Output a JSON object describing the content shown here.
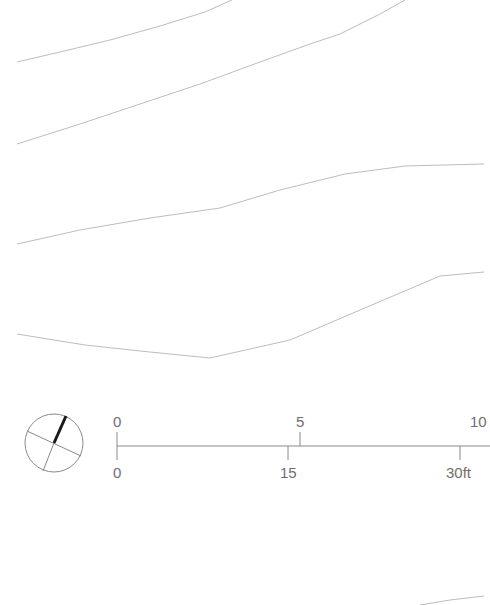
{
  "drawing": {
    "type": "site plan contour lines",
    "contour_color": "#bdbdbd",
    "contours": [
      {
        "id": "c1",
        "points": [
          [
            17,
            62
          ],
          [
            60,
            52
          ],
          [
            110,
            40
          ],
          [
            160,
            26
          ],
          [
            205,
            12
          ],
          [
            232,
            0
          ]
        ]
      },
      {
        "id": "c2",
        "points": [
          [
            17,
            144
          ],
          [
            80,
            124
          ],
          [
            140,
            104
          ],
          [
            200,
            84
          ],
          [
            260,
            62
          ],
          [
            310,
            44
          ],
          [
            340,
            34
          ],
          [
            380,
            14
          ],
          [
            405,
            0
          ]
        ]
      },
      {
        "id": "c3",
        "points": [
          [
            17,
            244
          ],
          [
            80,
            230
          ],
          [
            150,
            218
          ],
          [
            220,
            208
          ],
          [
            280,
            190
          ],
          [
            345,
            174
          ],
          [
            405,
            166
          ],
          [
            484,
            164
          ]
        ]
      },
      {
        "id": "c4",
        "points": [
          [
            17,
            334
          ],
          [
            85,
            345
          ],
          [
            150,
            352
          ],
          [
            210,
            358
          ],
          [
            290,
            340
          ],
          [
            360,
            310
          ],
          [
            440,
            276
          ],
          [
            484,
            272
          ]
        ]
      },
      {
        "id": "c5",
        "points": [
          [
            420,
            605
          ],
          [
            450,
            600
          ],
          [
            484,
            596
          ]
        ]
      }
    ]
  },
  "compass": {
    "label": "north arrow",
    "cx": 54,
    "cy": 443,
    "r": 29,
    "needle_color": "#1a1a1a"
  },
  "scale_bar": {
    "top_unit": "m",
    "bottom_unit": "ft",
    "top_labels": [
      {
        "text": "0",
        "x": 117
      },
      {
        "text": "5",
        "x": 300
      },
      {
        "text": "10",
        "x": 484
      }
    ],
    "bottom_labels": [
      {
        "text": "0",
        "x": 117
      },
      {
        "text": "15",
        "x": 288
      },
      {
        "text": "30ft",
        "x": 460
      }
    ],
    "line_color": "#8a8a8a"
  }
}
